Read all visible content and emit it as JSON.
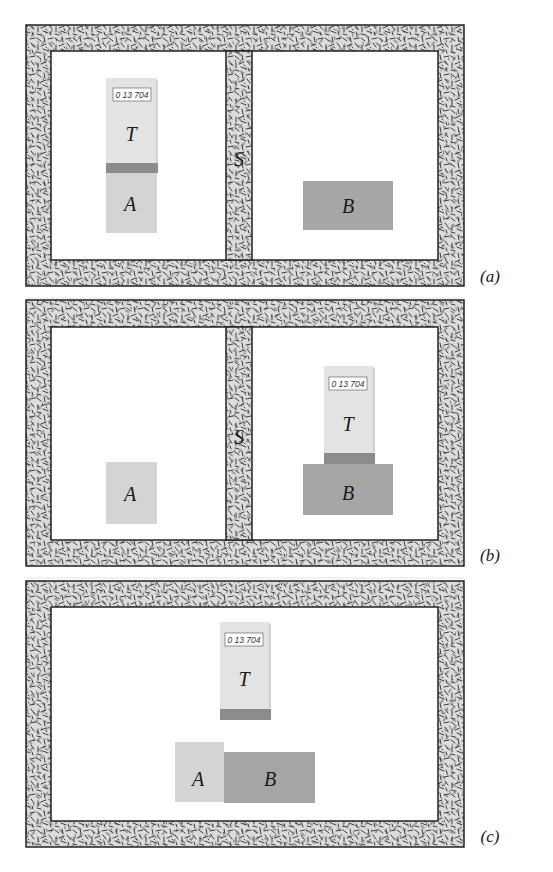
{
  "figure": {
    "colors": {
      "insulation_fill": "#d9d9d9",
      "insulation_stroke": "#2b2b2b",
      "thermometer_body": "#e3e3e3",
      "thermometer_band": "#8c8c8c",
      "body_A": "#d4d4d4",
      "body_B": "#a6a6a6",
      "display_bg": "#ffffff"
    }
  },
  "panels": [
    {
      "id": "a",
      "caption": "(a)",
      "has_wall": true,
      "wall_label": "S",
      "thermometer": {
        "label": "T",
        "reading": "0 13 704",
        "location": "left chamber, resting on A"
      },
      "body_A": {
        "label": "A",
        "location": "left chamber"
      },
      "body_B": {
        "label": "B",
        "location": "right chamber"
      }
    },
    {
      "id": "b",
      "caption": "(b)",
      "has_wall": true,
      "wall_label": "S",
      "thermometer": {
        "label": "T",
        "reading": "0 13 704",
        "location": "right chamber, resting on B"
      },
      "body_A": {
        "label": "A",
        "location": "left chamber"
      },
      "body_B": {
        "label": "B",
        "location": "right chamber"
      }
    },
    {
      "id": "c",
      "caption": "(c)",
      "has_wall": false,
      "thermometer": {
        "label": "T",
        "reading": "0 13 704",
        "location": "above A and B"
      },
      "body_A": {
        "label": "A",
        "location": "in contact with B"
      },
      "body_B": {
        "label": "B",
        "location": "in contact with A"
      }
    }
  ]
}
